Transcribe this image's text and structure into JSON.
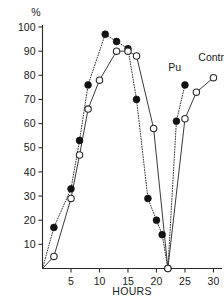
{
  "chart_data": {
    "type": "line",
    "title": "",
    "xlabel": "HOURS",
    "ylabel": "%",
    "xlim": [
      0,
      31.5
    ],
    "ylim": [
      0,
      103
    ],
    "grid": false,
    "legend_position": "inline-annotation",
    "xticks": [
      5,
      10,
      15,
      20,
      25,
      30
    ],
    "yticks": [
      10,
      20,
      30,
      40,
      50,
      60,
      70,
      80,
      90,
      100
    ],
    "annotations": [
      {
        "text": "Pu",
        "x": 23.2,
        "y": 82
      },
      {
        "text": "Contr",
        "x": 29.6,
        "y": 86
      }
    ],
    "series": [
      {
        "name": "Pu",
        "marker": "filled-circle",
        "linestyle": "dotted",
        "points": [
          {
            "x": 0,
            "y": 0
          },
          {
            "x": 2,
            "y": 17
          },
          {
            "x": 5,
            "y": 33
          },
          {
            "x": 6.5,
            "y": 53
          },
          {
            "x": 8,
            "y": 76
          },
          {
            "x": 11,
            "y": 97
          },
          {
            "x": 13,
            "y": 94
          },
          {
            "x": 15,
            "y": 91
          },
          {
            "x": 16.5,
            "y": 70
          },
          {
            "x": 18.5,
            "y": 29
          },
          {
            "x": 20,
            "y": 20
          },
          {
            "x": 21,
            "y": 14
          },
          {
            "x": 22,
            "y": 0
          },
          {
            "x": 23.5,
            "y": 61
          },
          {
            "x": 25,
            "y": 76
          }
        ]
      },
      {
        "name": "Contr",
        "marker": "open-circle",
        "linestyle": "solid",
        "points": [
          {
            "x": 0,
            "y": 0
          },
          {
            "x": 2,
            "y": 5
          },
          {
            "x": 5,
            "y": 29
          },
          {
            "x": 6.5,
            "y": 47
          },
          {
            "x": 8,
            "y": 66
          },
          {
            "x": 10,
            "y": 78
          },
          {
            "x": 13,
            "y": 90
          },
          {
            "x": 15,
            "y": 90
          },
          {
            "x": 16.5,
            "y": 88
          },
          {
            "x": 19.5,
            "y": 58
          },
          {
            "x": 22,
            "y": 0
          },
          {
            "x": 25,
            "y": 62
          },
          {
            "x": 27,
            "y": 73
          },
          {
            "x": 30,
            "y": 79
          }
        ]
      }
    ]
  },
  "labels": {
    "unit": "%",
    "xaxis_title": "HOURS",
    "pu": "Pu",
    "contr": "Contr",
    "ytick_100": "100",
    "ytick_90": "90",
    "ytick_80": "80",
    "ytick_70": "70",
    "ytick_60": "60",
    "ytick_50": "50",
    "ytick_40": "40",
    "ytick_30": "30",
    "ytick_20": "20",
    "ytick_10": "10",
    "xtick_5": "5",
    "xtick_10": "10",
    "xtick_15": "15",
    "xtick_20": "20",
    "xtick_25": "25",
    "xtick_30": "30"
  },
  "colors": {
    "axis": "#2b2b2b",
    "line": "#3a3a3a",
    "filled_marker": "#111111",
    "open_marker_fill": "#ffffff",
    "background": "#ffffff"
  }
}
